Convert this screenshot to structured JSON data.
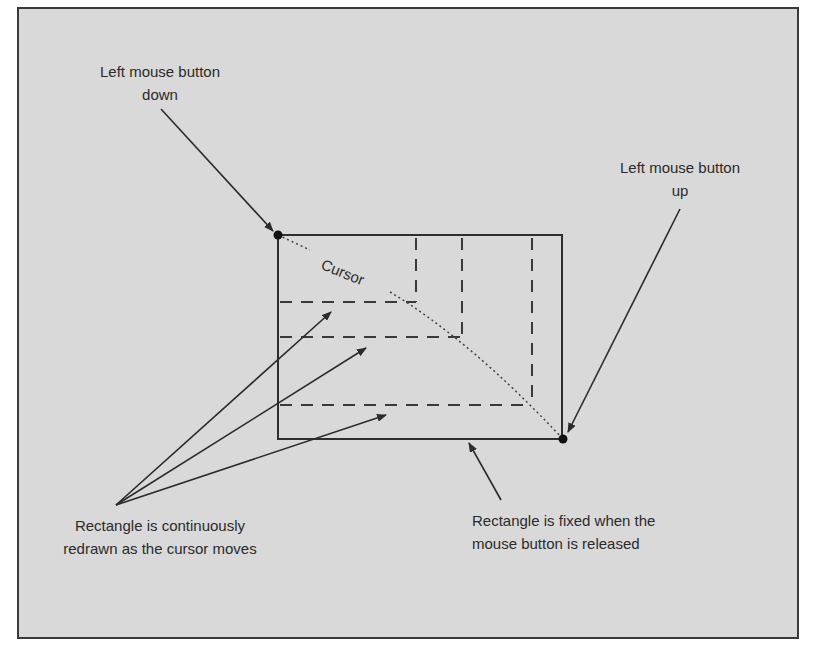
{
  "figure": {
    "background_color": "#d9d9d9",
    "stroke_color": "#333333",
    "labels": {
      "button_down": [
        "Left mouse button",
        "down"
      ],
      "button_up": [
        "Left mouse button",
        "up"
      ],
      "cursor": "Cursor",
      "continuously_redrawn": [
        "Rectangle is continuously",
        "redrawn as the cursor moves"
      ],
      "fixed_on_release": [
        "Rectangle is fixed when the",
        "mouse button is released"
      ]
    },
    "final_rectangle": {
      "x1": 278,
      "y1": 235,
      "x2": 562,
      "y2": 439
    },
    "intermediate_rectangles": [
      {
        "right_x": 416,
        "bottom_y": 302
      },
      {
        "right_x": 462,
        "bottom_y": 337
      },
      {
        "right_x": 532,
        "bottom_y": 405
      }
    ],
    "points": {
      "start": {
        "x": 278,
        "y": 235
      },
      "end": {
        "x": 563,
        "y": 439
      }
    }
  }
}
